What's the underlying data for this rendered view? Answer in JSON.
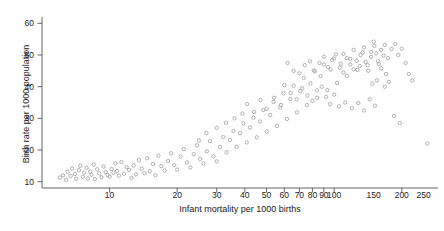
{
  "chart_data": {
    "type": "scatter",
    "title": "",
    "xlabel": "Infant mortality per 1000 births",
    "ylabel": "Birth rate per 1000 population",
    "xscale": "log",
    "yscale": "linear",
    "xlim": [
      5,
      290
    ],
    "ylim": [
      8,
      62
    ],
    "xticks": [
      10,
      20,
      30,
      40,
      50,
      60,
      70,
      80,
      90,
      100,
      150,
      200,
      250
    ],
    "xtick_labels": [
      "10",
      "20",
      "30",
      "40",
      "50",
      "60",
      "70",
      "80",
      "90",
      "100",
      "150",
      "200",
      "250"
    ],
    "yticks": [
      10,
      20,
      30,
      40,
      50,
      60
    ],
    "ytick_labels": [
      "10",
      "20",
      "30",
      "40",
      "50",
      "60"
    ],
    "grid": false,
    "legend": null,
    "marker": "open-circle",
    "marker_color": "#9a9a9a",
    "marker_size": 3.4,
    "n_points": 182,
    "points": [
      [
        6.0,
        11.3
      ],
      [
        6.2,
        12.0
      ],
      [
        6.4,
        10.6
      ],
      [
        6.5,
        13.1
      ],
      [
        6.7,
        11.8
      ],
      [
        6.8,
        14.2
      ],
      [
        7.0,
        12.4
      ],
      [
        7.1,
        10.9
      ],
      [
        7.3,
        13.6
      ],
      [
        7.4,
        15.0
      ],
      [
        7.6,
        11.5
      ],
      [
        7.7,
        12.9
      ],
      [
        7.9,
        14.4
      ],
      [
        8.0,
        11.0
      ],
      [
        8.2,
        13.2
      ],
      [
        8.3,
        12.2
      ],
      [
        8.5,
        15.4
      ],
      [
        8.6,
        10.8
      ],
      [
        8.8,
        13.9
      ],
      [
        9.0,
        12.6
      ],
      [
        9.2,
        11.4
      ],
      [
        9.4,
        14.8
      ],
      [
        9.6,
        13.0
      ],
      [
        9.8,
        12.1
      ],
      [
        10.0,
        11.6
      ],
      [
        10.2,
        14.0
      ],
      [
        10.4,
        12.8
      ],
      [
        10.6,
        15.8
      ],
      [
        10.8,
        13.4
      ],
      [
        11.0,
        11.9
      ],
      [
        11.3,
        16.2
      ],
      [
        11.6,
        12.5
      ],
      [
        11.9,
        14.6
      ],
      [
        12.2,
        13.7
      ],
      [
        12.5,
        11.2
      ],
      [
        12.8,
        15.1
      ],
      [
        13.1,
        12.3
      ],
      [
        13.5,
        16.8
      ],
      [
        13.9,
        14.1
      ],
      [
        14.3,
        12.7
      ],
      [
        14.7,
        17.4
      ],
      [
        15.1,
        13.3
      ],
      [
        15.6,
        15.6
      ],
      [
        16.0,
        12.0
      ],
      [
        16.5,
        18.2
      ],
      [
        17.0,
        14.9
      ],
      [
        17.6,
        13.5
      ],
      [
        18.2,
        16.5
      ],
      [
        18.8,
        19.0
      ],
      [
        19.4,
        15.2
      ],
      [
        20.0,
        13.8
      ],
      [
        20.7,
        17.9
      ],
      [
        21.4,
        20.3
      ],
      [
        22.1,
        16.1
      ],
      [
        22.9,
        14.5
      ],
      [
        23.7,
        18.7
      ],
      [
        24.5,
        21.5
      ],
      [
        25.3,
        17.2
      ],
      [
        26.2,
        15.7
      ],
      [
        27.1,
        19.6
      ],
      [
        28.0,
        22.8
      ],
      [
        29.0,
        18.0
      ],
      [
        30.0,
        16.4
      ],
      [
        31.0,
        20.9
      ],
      [
        32.1,
        24.1
      ],
      [
        33.2,
        19.3
      ],
      [
        34.4,
        23.2
      ],
      [
        35.6,
        26.0
      ],
      [
        36.8,
        21.0
      ],
      [
        38.1,
        25.3
      ],
      [
        39.4,
        28.4
      ],
      [
        40.8,
        22.4
      ],
      [
        42.2,
        27.1
      ],
      [
        43.7,
        30.2
      ],
      [
        45.2,
        24.0
      ],
      [
        46.8,
        29.0
      ],
      [
        48.4,
        32.6
      ],
      [
        50.1,
        25.8
      ],
      [
        51.9,
        31.0
      ],
      [
        53.7,
        35.2
      ],
      [
        55.6,
        27.6
      ],
      [
        57.5,
        33.4
      ],
      [
        59.5,
        37.9
      ],
      [
        61.6,
        29.8
      ],
      [
        63.8,
        36.1
      ],
      [
        66.0,
        40.3
      ],
      [
        68.3,
        31.9
      ],
      [
        70.7,
        38.6
      ],
      [
        73.2,
        42.8
      ],
      [
        75.8,
        34.2
      ],
      [
        78.4,
        41.0
      ],
      [
        81.2,
        45.1
      ],
      [
        84.0,
        36.5
      ],
      [
        87.0,
        43.3
      ],
      [
        90.0,
        47.0
      ],
      [
        93.2,
        38.9
      ],
      [
        96.4,
        45.4
      ],
      [
        99.8,
        48.9
      ],
      [
        103,
        41.2
      ],
      [
        107,
        47.2
      ],
      [
        110,
        50.4
      ],
      [
        114,
        43.4
      ],
      [
        118,
        48.8
      ],
      [
        122,
        51.6
      ],
      [
        127,
        45.3
      ],
      [
        131,
        50.0
      ],
      [
        136,
        52.4
      ],
      [
        141,
        46.8
      ],
      [
        146,
        51.0
      ],
      [
        151,
        52.9
      ],
      [
        157,
        48.0
      ],
      [
        162,
        51.6
      ],
      [
        168,
        53.2
      ],
      [
        174,
        49.0
      ],
      [
        180,
        51.9
      ],
      [
        187,
        53.5
      ],
      [
        193,
        50.0
      ],
      [
        200,
        52.0
      ],
      [
        208,
        47.5
      ],
      [
        215,
        44.0
      ],
      [
        223,
        42.0
      ],
      [
        62,
        47.5
      ],
      [
        66,
        45.0
      ],
      [
        70,
        44.2
      ],
      [
        74,
        46.8
      ],
      [
        78,
        48.0
      ],
      [
        82,
        44.8
      ],
      [
        86,
        47.5
      ],
      [
        90,
        49.5
      ],
      [
        94,
        46.2
      ],
      [
        98,
        48.4
      ],
      [
        102,
        50.2
      ],
      [
        106,
        46.0
      ],
      [
        110,
        44.5
      ],
      [
        114,
        49.0
      ],
      [
        118,
        47.0
      ],
      [
        122,
        45.5
      ],
      [
        126,
        48.2
      ],
      [
        130,
        46.5
      ],
      [
        134,
        50.8
      ],
      [
        138,
        47.8
      ],
      [
        142,
        45.0
      ],
      [
        146,
        49.4
      ],
      [
        150,
        54.2
      ],
      [
        154,
        50.5
      ],
      [
        158,
        47.2
      ],
      [
        162,
        45.8
      ],
      [
        166,
        49.8
      ],
      [
        170,
        44.0
      ],
      [
        60,
        40.5
      ],
      [
        64,
        38.0
      ],
      [
        68,
        36.0
      ],
      [
        72,
        39.5
      ],
      [
        76,
        37.2
      ],
      [
        80,
        35.5
      ],
      [
        84,
        38.8
      ],
      [
        88,
        40.0
      ],
      [
        92,
        36.8
      ],
      [
        96,
        34.5
      ],
      [
        100,
        37.5
      ],
      [
        105,
        33.8
      ],
      [
        112,
        35.0
      ],
      [
        120,
        33.2
      ],
      [
        128,
        34.8
      ],
      [
        136,
        32.5
      ],
      [
        144,
        36.0
      ],
      [
        152,
        34.0
      ],
      [
        41,
        34.5
      ],
      [
        44,
        32.0
      ],
      [
        47,
        35.8
      ],
      [
        50,
        33.0
      ],
      [
        54,
        36.5
      ],
      [
        58,
        34.2
      ],
      [
        36,
        30.0
      ],
      [
        39,
        31.5
      ],
      [
        33,
        28.6
      ],
      [
        30,
        27.0
      ],
      [
        27,
        25.4
      ],
      [
        25,
        23.0
      ],
      [
        260,
        22.0
      ],
      [
        185,
        30.8
      ],
      [
        196,
        28.5
      ],
      [
        175,
        41.5
      ],
      [
        168,
        40.0
      ],
      [
        155,
        42.0
      ],
      [
        148,
        41.0
      ]
    ]
  }
}
